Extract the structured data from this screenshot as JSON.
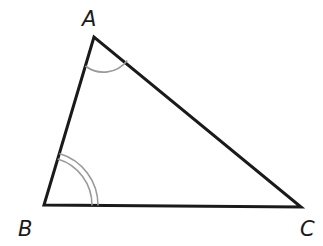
{
  "diagram": {
    "type": "triangle",
    "vertices": [
      {
        "label": "A",
        "x": 94,
        "y": 37,
        "label_x": 82,
        "label_y": 26
      },
      {
        "label": "B",
        "x": 44,
        "y": 205,
        "label_x": 18,
        "label_y": 236
      },
      {
        "label": "C",
        "x": 301,
        "y": 207,
        "label_x": 300,
        "label_y": 236
      }
    ],
    "angle_marks": [
      {
        "vertex": "A",
        "arcs": 1
      },
      {
        "vertex": "B",
        "arcs": 2
      }
    ],
    "colors": {
      "edge": "#1a1a1a",
      "arc": "#9a9a9a",
      "background": "#ffffff"
    }
  }
}
